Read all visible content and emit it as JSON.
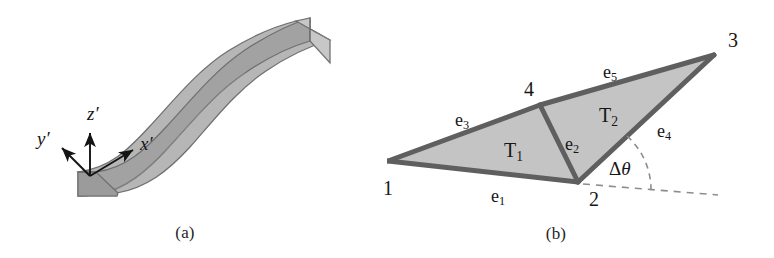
{
  "figure": {
    "background_color": "#ffffff",
    "width": 774,
    "height": 258
  },
  "panels": [
    {
      "id": "a",
      "caption": "(a)",
      "description": "Three-dimensional S-shaped curved beam with local coordinate frame",
      "colors": {
        "top_face": "#b4b4b4",
        "side_face": "#a0a0a0",
        "end_face": "#c6c6c6",
        "outline": "#6e6e6e",
        "axis": "#141414"
      },
      "axes": [
        {
          "name": "x-prime",
          "label": "x",
          "prime": "′",
          "direction": "along-beam-right-up"
        },
        {
          "name": "y-prime",
          "label": "y",
          "prime": "′",
          "direction": "upper-left"
        },
        {
          "name": "z-prime",
          "label": "z",
          "prime": "′",
          "direction": "up"
        }
      ]
    },
    {
      "id": "b",
      "caption": "(b)",
      "description": "Two shaded triangles sharing an edge, with dihedral angle increment",
      "colors": {
        "fill": "#c3c3c3",
        "edge": "#5f5f5f",
        "dashed": "#8d8d8d",
        "text": "#161616"
      },
      "nodes": [
        {
          "id": "1",
          "label": "1"
        },
        {
          "id": "2",
          "label": "2"
        },
        {
          "id": "3",
          "label": "3"
        },
        {
          "id": "4",
          "label": "4"
        }
      ],
      "edges": [
        {
          "id": "e1",
          "base": "e",
          "sub": "1"
        },
        {
          "id": "e2",
          "base": "e",
          "sub": "2"
        },
        {
          "id": "e3",
          "base": "e",
          "sub": "3"
        },
        {
          "id": "e4",
          "base": "e",
          "sub": "4"
        },
        {
          "id": "e5",
          "base": "e",
          "sub": "5"
        }
      ],
      "triangles": [
        {
          "id": "T1",
          "base": "T",
          "sub": "1"
        },
        {
          "id": "T2",
          "base": "T",
          "sub": "2"
        }
      ],
      "angle": {
        "delta": "Δ",
        "symbol": "θ",
        "name": "delta-theta"
      }
    }
  ]
}
